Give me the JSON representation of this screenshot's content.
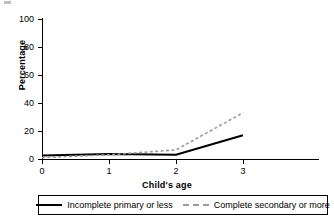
{
  "chart_data": {
    "type": "line",
    "title": "",
    "xlabel": "Child's age",
    "ylabel": "Percentage",
    "x": [
      0,
      1,
      2,
      3
    ],
    "xtick_labels": [
      "0",
      "1",
      "2",
      "3"
    ],
    "ytick_labels": [
      "0",
      "20",
      "40",
      "60",
      "80",
      "100"
    ],
    "yticks": [
      0,
      20,
      40,
      60,
      80,
      100
    ],
    "xlim": [
      -0.25,
      3.4
    ],
    "ylim": [
      0,
      100
    ],
    "grid": false,
    "legend_position": "bottom",
    "series": [
      {
        "name": "Incomplete primary or less",
        "style": "solid",
        "color": "#000000",
        "values": [
          2.5,
          3.5,
          3,
          17
        ]
      },
      {
        "name": "Complete secondary or more",
        "style": "dashed",
        "color": "#9a9a9a",
        "values": [
          1,
          3,
          6.5,
          33
        ]
      }
    ]
  },
  "legend": {
    "items": [
      {
        "label": "Incomplete primary or less",
        "style": "solid"
      },
      {
        "label": "Complete secondary or more",
        "style": "dashed"
      }
    ]
  }
}
